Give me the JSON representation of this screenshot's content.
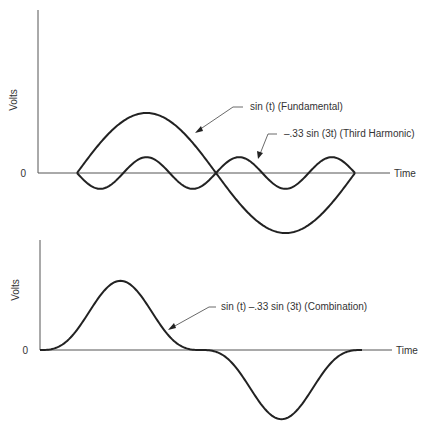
{
  "chart_data": [
    {
      "type": "line",
      "title": "",
      "xlabel": "Time",
      "ylabel": "Volts",
      "y_zero_label": "0",
      "series": [
        {
          "name": "sin (t) (Fundamental)",
          "function": "sin(t)",
          "amplitude": 1.0,
          "x_range": [
            0,
            6.283
          ]
        },
        {
          "name": "-.33 sin (3t) (Third Harmonic)",
          "function": "-0.33*sin(3t)",
          "amplitude": 0.33,
          "x_range": [
            0,
            6.283
          ]
        }
      ],
      "annotations": [
        "sin (t) (Fundamental)",
        "–.33 sin (3t) (Third Harmonic)"
      ],
      "grid": false
    },
    {
      "type": "line",
      "title": "",
      "xlabel": "Time",
      "ylabel": "Volts",
      "y_zero_label": "0",
      "series": [
        {
          "name": "sin (t) -.33 sin (3t) (Combination)",
          "function": "sin(t)-0.33*sin(3t)",
          "peak": 1.33,
          "trough": -1.33,
          "x_range": [
            0,
            6.283
          ]
        }
      ],
      "annotations": [
        "sin (t) –.33 sin (3t) (Combination)"
      ],
      "grid": false
    }
  ],
  "top": {
    "ylabel": "Volts",
    "zero": "0",
    "xlabel": "Time",
    "fund_label": "sin (t) (Fundamental)",
    "harm_label": "–.33 sin (3t) (Third Harmonic)"
  },
  "bottom": {
    "ylabel": "Volts",
    "zero": "0",
    "xlabel": "Time",
    "comb_label": "sin (t) –.33 sin (3t) (Combination)"
  }
}
